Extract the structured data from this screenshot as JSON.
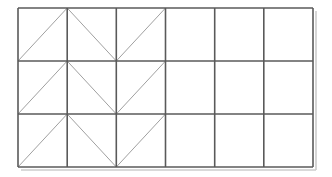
{
  "figure": {
    "background_color": "#ffffff"
  },
  "canvas": {
    "width": 332,
    "height": 177
  },
  "grid": {
    "columns": 6,
    "rows": 3,
    "left": 18,
    "top": 8,
    "right": 313,
    "bottom": 167,
    "cell_width": 49.17,
    "cell_height": 53.0,
    "line_color": "#5a5a5a",
    "line_width": 1.6,
    "column_x": [
      18,
      67.2,
      116.3,
      165.5,
      214.7,
      263.8,
      313
    ],
    "row_y": [
      8,
      61,
      114,
      167
    ]
  },
  "diagonals": {
    "line_color": "#a0a0a0",
    "line_width": 1.0,
    "legend": {
      "slash": "diagonal from bottom-left to top-right",
      "backslash": "diagonal from top-left to bottom-right",
      "none": "cell has no diagonal"
    },
    "pattern_rows": [
      [
        "slash",
        "backslash",
        "slash",
        "none",
        "none",
        "none"
      ],
      [
        "slash",
        "backslash",
        "slash",
        "none",
        "none",
        "none"
      ],
      [
        "slash",
        "backslash",
        "slash",
        "none",
        "none",
        "none"
      ]
    ]
  },
  "shadow": {
    "color": "#cccccc",
    "offset_x": 3,
    "offset_y": 3
  },
  "counts": {
    "total_cells": "18",
    "cells_with_diagonal": "9",
    "empty_cells": "9",
    "triangles": "18"
  }
}
